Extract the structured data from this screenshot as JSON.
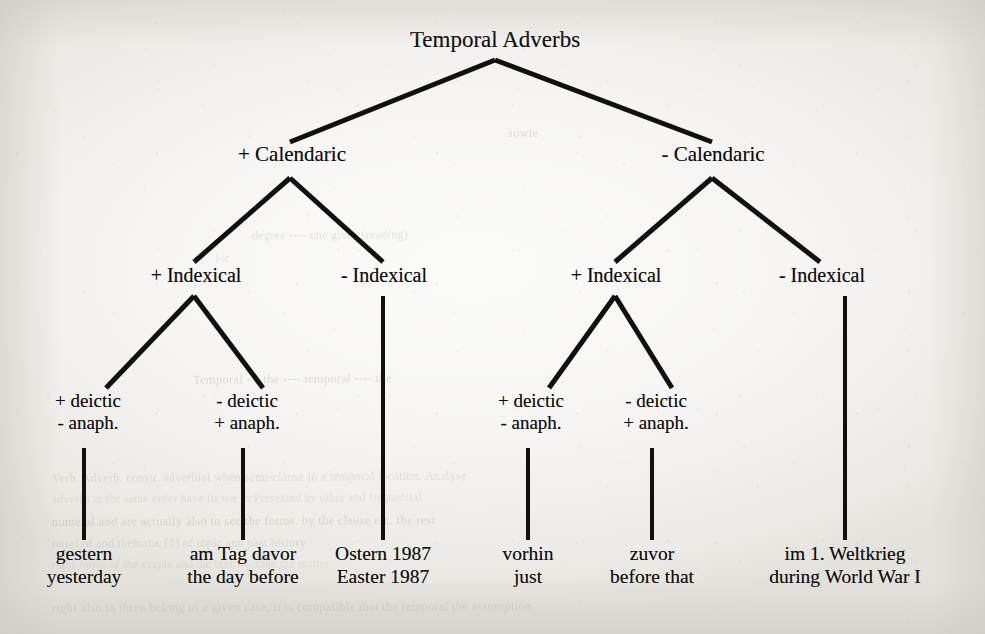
{
  "figure": {
    "type": "taxonomy-tree",
    "title": "Temporal Adverbs",
    "language_pair": "German → English",
    "line_color": "#101010",
    "paper_color": "#f2f1ef",
    "ink_color": "#0d0d0d"
  },
  "tree": {
    "root": {
      "label": "Temporal Adverbs"
    },
    "level2": [
      {
        "label": "+ Calendaric"
      },
      {
        "label": "- Calendaric"
      }
    ],
    "level3": [
      {
        "label": "+ Indexical"
      },
      {
        "label": "- Indexical"
      },
      {
        "label": "+ Indexical"
      },
      {
        "label": "- Indexical"
      }
    ],
    "level4": [
      {
        "line1": "+ deictic",
        "line2": "- anaph."
      },
      {
        "line1": "- deictic",
        "line2": "+ anaph."
      },
      {
        "line1": "+ deictic",
        "line2": "- anaph."
      },
      {
        "line1": "- deictic",
        "line2": "+ anaph."
      }
    ],
    "leaves": [
      {
        "german": "gestern",
        "english": "yesterday"
      },
      {
        "german": "am Tag davor",
        "english": "the day before"
      },
      {
        "german": "Ostern 1987",
        "english": "Easter 1987"
      },
      {
        "german": "vorhin",
        "english": "just"
      },
      {
        "german": "zuvor",
        "english": "before that"
      },
      {
        "german": "im 1. Weltkrieg",
        "english": "during World War I"
      }
    ]
  },
  "showthrough": [
    {
      "text": "sowie",
      "x": 508,
      "y": 126,
      "rot": -0.6
    },
    {
      "text": "degree ---- one gives (reading)",
      "x": 252,
      "y": 228,
      "rot": -0.4
    },
    {
      "text": "for",
      "x": 215,
      "y": 252,
      "rot": -0.3
    },
    {
      "text": "Temporal --- the ---- temporal ---- the",
      "x": 193,
      "y": 372,
      "rot": -0.5
    },
    {
      "text": "Verb. Adverb.  constr. adverbial  when  semi-clause  in a  temporal  location.  Analyse",
      "x": 52,
      "y": 470,
      "rot": -0.35
    },
    {
      "text": "adverbs in the same order have  its use in  Presented by  other  and  frequential",
      "x": 52,
      "y": 492,
      "rot": -0.3
    },
    {
      "text": "numeral  and  are  actually  also  to  see  the  forms.  by  the  clause  etc.  the  rest",
      "x": 52,
      "y": 514,
      "rot": -0.3
    },
    {
      "text": "onset  of  and  thematic  [1]  of  topic  and  past  history",
      "x": 52,
      "y": 536,
      "rot": -0.25
    },
    {
      "text": "right  forms  of  the  events  and  the  text  ----  than  the  matter",
      "x": 52,
      "y": 558,
      "rot": -0.25
    },
    {
      "text": "right  also  in  three  belong  to  a  given  case,  it  is  compatible  that  the  temporal  the  assumption",
      "x": 52,
      "y": 600,
      "rot": -0.2
    }
  ]
}
